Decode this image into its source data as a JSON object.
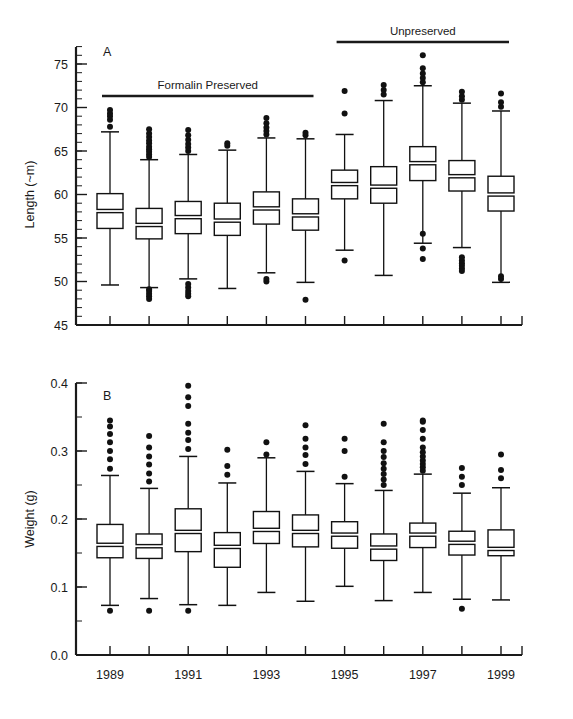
{
  "figure": {
    "background_color": "#ffffff",
    "line_color": "#111111"
  },
  "panels": {
    "a": {
      "letter": "A",
      "ylabel": "Length (~m)",
      "group_labels": [
        {
          "text": "Formalin Preserved"
        },
        {
          "text": "Unpreserved"
        }
      ]
    },
    "b": {
      "letter": "B",
      "ylabel": "Weight (g)"
    }
  },
  "chart_data": [
    {
      "type": "box",
      "id": "panel-a-length",
      "title": "A",
      "xlabel": "",
      "ylabel": "Length (~m)",
      "ylim": [
        45,
        78
      ],
      "yticks": [
        45,
        50,
        55,
        60,
        65,
        70,
        75
      ],
      "ytick_labels": [
        "45",
        "50",
        "55",
        "60",
        "65",
        "70",
        "75"
      ],
      "minor_tick_step": 1,
      "grid": false,
      "legend": "none",
      "annotations": [
        {
          "text": "Formalin Preserved",
          "spans_categories": [
            "1989",
            "1994"
          ]
        },
        {
          "text": "Unpreserved",
          "spans_categories": [
            "1995",
            "1999"
          ]
        }
      ],
      "categories": [
        "1989",
        "1990",
        "1991",
        "1992",
        "1993",
        "1994",
        "1995",
        "1996",
        "1997",
        "1998",
        "1999"
      ],
      "boxes": [
        {
          "category": "1989",
          "whisker_low": 49.6,
          "q1": 56.1,
          "median": 58.1,
          "q3": 60.1,
          "whisker_high": 67.2,
          "outliers": [
            67.8,
            68.6,
            69.0,
            69.3,
            69.7
          ]
        },
        {
          "category": "1990",
          "whisker_low": 49.3,
          "q1": 54.9,
          "median": 56.5,
          "q3": 58.4,
          "whisker_high": 64.0,
          "outliers": [
            64.3,
            64.6,
            64.9,
            65.2,
            65.5,
            65.9,
            66.2,
            66.6,
            67.0,
            67.5,
            48.0,
            48.3,
            48.6,
            48.9,
            49.1
          ]
        },
        {
          "category": "1991",
          "whisker_low": 50.3,
          "q1": 55.5,
          "median": 57.4,
          "q3": 59.2,
          "whisker_high": 64.6,
          "outliers": [
            65.0,
            65.4,
            65.8,
            66.3,
            66.8,
            67.4,
            48.3,
            48.6,
            48.9,
            49.3,
            49.7
          ]
        },
        {
          "category": "1992",
          "whisker_low": 49.2,
          "q1": 55.3,
          "median": 57.0,
          "q3": 59.0,
          "whisker_high": 65.1,
          "outliers": [
            65.6,
            65.9
          ]
        },
        {
          "category": "1993",
          "whisker_low": 51.0,
          "q1": 56.6,
          "median": 58.4,
          "q3": 60.3,
          "whisker_high": 66.5,
          "outliers": [
            66.9,
            67.3,
            67.7,
            68.2,
            68.8,
            50.0,
            50.3
          ]
        },
        {
          "category": "1994",
          "whisker_low": 49.9,
          "q1": 55.9,
          "median": 57.6,
          "q3": 59.5,
          "whisker_high": 66.4,
          "outliers": [
            66.8,
            67.1,
            47.9
          ]
        },
        {
          "category": "1995",
          "whisker_low": 53.6,
          "q1": 59.5,
          "median": 61.2,
          "q3": 62.8,
          "whisker_high": 66.9,
          "outliers": [
            71.9,
            69.3,
            52.4
          ]
        },
        {
          "category": "1996",
          "whisker_low": 50.7,
          "q1": 59.0,
          "median": 60.9,
          "q3": 63.2,
          "whisker_high": 70.8,
          "outliers": [
            71.5,
            72.0,
            72.6
          ]
        },
        {
          "category": "1997",
          "whisker_low": 54.4,
          "q1": 61.6,
          "median": 63.6,
          "q3": 65.5,
          "whisker_high": 72.5,
          "outliers": [
            72.9,
            73.4,
            73.9,
            74.5,
            76.0,
            55.5,
            53.8,
            52.6
          ]
        },
        {
          "category": "1998",
          "whisker_low": 53.9,
          "q1": 60.4,
          "median": 62.1,
          "q3": 63.9,
          "whisker_high": 70.5,
          "outliers": [
            70.9,
            71.3,
            71.8,
            51.2,
            51.5,
            51.8,
            52.1,
            52.4,
            52.8
          ]
        },
        {
          "category": "1999",
          "whisker_low": 49.9,
          "q1": 58.1,
          "median": 60.0,
          "q3": 62.1,
          "whisker_high": 69.6,
          "outliers": [
            70.1,
            70.6,
            71.6,
            50.3,
            50.6
          ]
        }
      ]
    },
    {
      "type": "box",
      "id": "panel-b-weight",
      "title": "B",
      "xlabel": "",
      "ylabel": "Weight (g)",
      "ylim": [
        0.0,
        0.42
      ],
      "yticks": [
        0.0,
        0.1,
        0.2,
        0.3,
        0.4
      ],
      "ytick_labels": [
        "0.0",
        "0.1",
        "0.2",
        "0.3",
        "0.4"
      ],
      "minor_tick_step": 0.05,
      "grid": false,
      "legend": "none",
      "categories": [
        "1989",
        "1990",
        "1991",
        "1992",
        "1993",
        "1994",
        "1995",
        "1996",
        "1997",
        "1998",
        "1999"
      ],
      "xtick_labels_shown": [
        "1989",
        "1991",
        "1993",
        "1995",
        "1997",
        "1999"
      ],
      "boxes": [
        {
          "category": "1989",
          "whisker_low": 0.073,
          "q1": 0.143,
          "median": 0.162,
          "q3": 0.192,
          "whisker_high": 0.264,
          "outliers": [
            0.274,
            0.288,
            0.3,
            0.313,
            0.325,
            0.336,
            0.345,
            0.065
          ]
        },
        {
          "category": "1990",
          "whisker_low": 0.083,
          "q1": 0.142,
          "median": 0.16,
          "q3": 0.178,
          "whisker_high": 0.245,
          "outliers": [
            0.255,
            0.267,
            0.28,
            0.292,
            0.305,
            0.322,
            0.065
          ]
        },
        {
          "category": "1991",
          "whisker_low": 0.074,
          "q1": 0.152,
          "median": 0.181,
          "q3": 0.215,
          "whisker_high": 0.292,
          "outliers": [
            0.303,
            0.316,
            0.327,
            0.34,
            0.366,
            0.379,
            0.396,
            0.065
          ]
        },
        {
          "category": "1992",
          "whisker_low": 0.073,
          "q1": 0.129,
          "median": 0.159,
          "q3": 0.18,
          "whisker_high": 0.253,
          "outliers": [
            0.265,
            0.278,
            0.302
          ]
        },
        {
          "category": "1993",
          "whisker_low": 0.092,
          "q1": 0.164,
          "median": 0.184,
          "q3": 0.211,
          "whisker_high": 0.29,
          "outliers": [
            0.295,
            0.313
          ]
        },
        {
          "category": "1994",
          "whisker_low": 0.079,
          "q1": 0.159,
          "median": 0.181,
          "q3": 0.206,
          "whisker_high": 0.27,
          "outliers": [
            0.281,
            0.294,
            0.305,
            0.318,
            0.338
          ]
        },
        {
          "category": "1995",
          "whisker_low": 0.101,
          "q1": 0.157,
          "median": 0.177,
          "q3": 0.196,
          "whisker_high": 0.252,
          "outliers": [
            0.262,
            0.3,
            0.318
          ]
        },
        {
          "category": "1996",
          "whisker_low": 0.08,
          "q1": 0.139,
          "median": 0.158,
          "q3": 0.178,
          "whisker_high": 0.242,
          "outliers": [
            0.25,
            0.258,
            0.266,
            0.274,
            0.282,
            0.291,
            0.3,
            0.313,
            0.34
          ]
        },
        {
          "category": "1997",
          "whisker_low": 0.092,
          "q1": 0.158,
          "median": 0.177,
          "q3": 0.194,
          "whisker_high": 0.266,
          "outliers": [
            0.271,
            0.276,
            0.281,
            0.286,
            0.292,
            0.298,
            0.305,
            0.318,
            0.331,
            0.343,
            0.345
          ]
        },
        {
          "category": "1998",
          "whisker_low": 0.082,
          "q1": 0.147,
          "median": 0.165,
          "q3": 0.182,
          "whisker_high": 0.238,
          "outliers": [
            0.25,
            0.262,
            0.275,
            0.068
          ]
        },
        {
          "category": "1999",
          "whisker_low": 0.081,
          "q1": 0.146,
          "median": 0.156,
          "q3": 0.184,
          "whisker_high": 0.246,
          "outliers": [
            0.26,
            0.272,
            0.295
          ]
        }
      ]
    }
  ]
}
